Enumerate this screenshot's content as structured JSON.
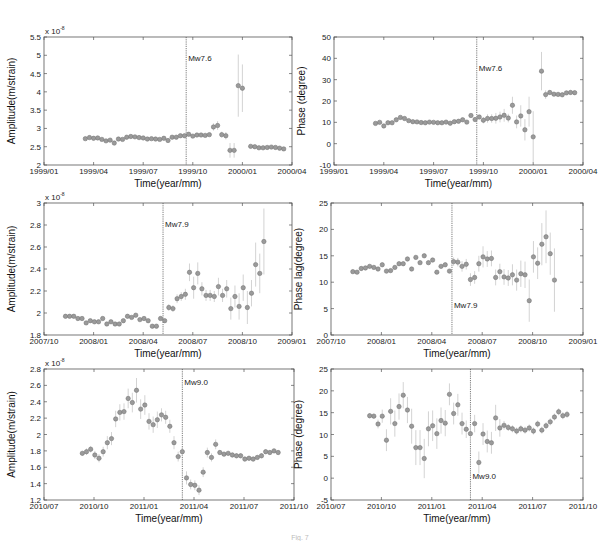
{
  "figure": {
    "caption_fragment": "Fig. 7"
  },
  "chart_data": [
    {
      "id": "p1",
      "type": "scatter",
      "title": "",
      "xlabel": "Time(year/mm)",
      "ylabel": "Amplitude(m/strain)",
      "y_multiplier": "x 10^-8",
      "xlim": [
        0,
        15
      ],
      "ylim": [
        2,
        5.5
      ],
      "xticks": [
        0,
        3,
        6,
        9,
        12,
        15
      ],
      "xticklabels": [
        "1999/01",
        "1999/04",
        "1999/07",
        "1999/10",
        "2000/01",
        "2000/04"
      ],
      "yticks": [
        2,
        2.5,
        3,
        3.5,
        4,
        4.5,
        5,
        5.5
      ],
      "yticklabels": [
        "2",
        "2.5",
        "3",
        "3.5",
        "4",
        "4.5",
        "5",
        "5.5"
      ],
      "event": {
        "x": 8.6,
        "label": "Mw7.6",
        "label_y": 4.85
      },
      "x": [
        2.5,
        2.75,
        3.0,
        3.25,
        3.5,
        3.75,
        4.0,
        4.25,
        4.5,
        4.75,
        5.0,
        5.25,
        5.5,
        5.75,
        6.0,
        6.25,
        6.5,
        6.75,
        7.0,
        7.25,
        7.5,
        7.75,
        8.0,
        8.25,
        8.5,
        8.75,
        9.0,
        9.25,
        9.5,
        9.75,
        10.0,
        10.25,
        10.5,
        10.75,
        11.0,
        11.25,
        11.5,
        11.75,
        12.0,
        12.5,
        12.75,
        13.0,
        13.25,
        13.5,
        13.75,
        14.0,
        14.25,
        14.5
      ],
      "values": [
        2.72,
        2.75,
        2.73,
        2.74,
        2.7,
        2.66,
        2.68,
        2.6,
        2.71,
        2.7,
        2.76,
        2.78,
        2.77,
        2.75,
        2.74,
        2.71,
        2.72,
        2.71,
        2.7,
        2.73,
        2.67,
        2.76,
        2.76,
        2.8,
        2.8,
        2.84,
        2.79,
        2.82,
        2.82,
        2.81,
        2.83,
        3.04,
        3.08,
        2.83,
        2.8,
        2.4,
        2.4,
        4.17,
        4.1,
        2.51,
        2.5,
        2.47,
        2.47,
        2.48,
        2.49,
        2.48,
        2.46,
        2.44
      ],
      "errors": [
        0.03,
        0.03,
        0.03,
        0.03,
        0.03,
        0.03,
        0.03,
        0.03,
        0.03,
        0.03,
        0.03,
        0.03,
        0.03,
        0.03,
        0.03,
        0.03,
        0.03,
        0.03,
        0.03,
        0.03,
        0.03,
        0.03,
        0.03,
        0.03,
        0.03,
        0.03,
        0.03,
        0.03,
        0.03,
        0.03,
        0.03,
        0.1,
        0.12,
        0.08,
        0.1,
        0.2,
        0.2,
        0.85,
        0.65,
        0.05,
        0.03,
        0.03,
        0.03,
        0.03,
        0.03,
        0.03,
        0.03,
        0.03
      ]
    },
    {
      "id": "p2",
      "type": "scatter",
      "title": "",
      "xlabel": "Time(year/mm)",
      "ylabel": "Phase (degree)",
      "xlim": [
        0,
        15
      ],
      "ylim": [
        -10,
        50
      ],
      "xticks": [
        0,
        3,
        6,
        9,
        12,
        15
      ],
      "xticklabels": [
        "1999/01",
        "1999/04",
        "1999/07",
        "1999/10",
        "2000/01",
        "2000/04"
      ],
      "yticks": [
        -10,
        0,
        10,
        20,
        30,
        40,
        50
      ],
      "yticklabels": [
        "-10",
        "0",
        "10",
        "20",
        "30",
        "40",
        "50"
      ],
      "event": {
        "x": 8.6,
        "label": "Mw7.6",
        "label_y": 34
      },
      "x": [
        2.5,
        2.75,
        3.0,
        3.25,
        3.5,
        3.75,
        4.0,
        4.25,
        4.5,
        4.75,
        5.0,
        5.25,
        5.5,
        5.75,
        6.0,
        6.25,
        6.5,
        6.75,
        7.0,
        7.25,
        7.5,
        7.75,
        8.0,
        8.25,
        8.5,
        8.75,
        9.0,
        9.25,
        9.5,
        9.75,
        10.0,
        10.25,
        10.5,
        10.75,
        11.0,
        11.25,
        11.5,
        11.75,
        12.0,
        12.5,
        12.75,
        13.0,
        13.25,
        13.5,
        13.75,
        14.0,
        14.25,
        14.5
      ],
      "values": [
        9.5,
        10,
        8.3,
        9.8,
        9.8,
        11.2,
        12.3,
        11.8,
        10.8,
        10.3,
        10.2,
        9.9,
        9.8,
        10.1,
        10.0,
        9.8,
        9.8,
        10.1,
        9.6,
        10.3,
        10.5,
        11.2,
        10.1,
        13.2,
        11.3,
        12.5,
        11,
        11.8,
        11.8,
        11.9,
        12.5,
        13.3,
        12,
        18,
        10.2,
        13,
        6.5,
        15,
        3.2,
        34,
        23,
        24,
        23.2,
        23.1,
        22.9,
        23.8,
        24,
        23.9,
        23.5,
        23
      ],
      "errors": [
        0.5,
        0.5,
        0.5,
        0.5,
        0.5,
        0.5,
        0.5,
        0.5,
        0.5,
        0.5,
        0.5,
        0.5,
        0.5,
        0.5,
        0.5,
        0.5,
        0.5,
        0.5,
        0.5,
        0.5,
        0.5,
        0.5,
        0.5,
        0.5,
        0.5,
        0.5,
        1.5,
        2,
        2,
        2.5,
        2.5,
        3,
        2,
        4,
        3,
        5,
        5,
        7,
        12,
        9,
        2,
        1,
        1,
        1,
        1,
        1,
        1,
        1,
        1,
        1
      ]
    },
    {
      "id": "p3",
      "type": "scatter",
      "title": "",
      "xlabel": "Time(year/mm)",
      "ylabel": "Amplitude(m/strain)",
      "y_multiplier": "x 10^-8",
      "xlim": [
        0,
        15
      ],
      "ylim": [
        1.8,
        3.0
      ],
      "xticks": [
        0,
        3,
        6,
        9,
        12,
        15
      ],
      "xticklabels": [
        "2007/10",
        "2008/01",
        "2008/04",
        "2008/07",
        "2008/10",
        "2009/01"
      ],
      "yticks": [
        1.8,
        2.0,
        2.2,
        2.4,
        2.6,
        2.8,
        3.0
      ],
      "yticklabels": [
        "1.8",
        "2",
        "2.2",
        "2.4",
        "2.6",
        "2.8",
        "3"
      ],
      "event": {
        "x": 7.2,
        "label": "Mw7.9",
        "label_y": 2.78
      },
      "x": [
        1.3,
        1.55,
        1.8,
        2.05,
        2.3,
        2.55,
        2.8,
        3.05,
        3.3,
        3.55,
        3.8,
        4.05,
        4.3,
        4.55,
        4.8,
        5.05,
        5.3,
        5.55,
        5.8,
        6.05,
        6.3,
        6.55,
        6.8,
        7.05,
        7.3,
        7.55,
        7.8,
        8.05,
        8.3,
        8.55,
        8.8,
        9.05,
        9.3,
        9.55,
        9.8,
        10.05,
        10.3,
        10.55,
        10.8,
        11.05,
        11.3,
        11.55,
        11.8,
        12.05,
        12.3,
        12.55,
        12.8,
        13.05,
        13.3
      ],
      "values": [
        1.97,
        1.97,
        1.97,
        1.95,
        1.95,
        1.91,
        1.93,
        1.92,
        1.92,
        1.95,
        1.9,
        1.92,
        1.9,
        1.9,
        1.93,
        1.97,
        1.96,
        1.98,
        1.94,
        1.95,
        1.93,
        1.88,
        1.88,
        1.95,
        1.93,
        2.05,
        2.04,
        2.13,
        2.15,
        2.17,
        2.37,
        2.23,
        2.36,
        2.22,
        2.16,
        2.16,
        2.15,
        2.24,
        2.16,
        2.22,
        2.04,
        2.15,
        2.06,
        2.23,
        2.05,
        2.18,
        2.44,
        2.36,
        2.65,
        2.36,
        2.28,
        2.12,
        2.21
      ],
      "errors": [
        0.01,
        0.01,
        0.01,
        0.01,
        0.01,
        0.01,
        0.01,
        0.01,
        0.01,
        0.01,
        0.01,
        0.01,
        0.01,
        0.01,
        0.01,
        0.01,
        0.01,
        0.01,
        0.01,
        0.01,
        0.01,
        0.01,
        0.01,
        0.01,
        0.01,
        0.03,
        0.03,
        0.04,
        0.04,
        0.05,
        0.08,
        0.1,
        0.1,
        0.06,
        0.05,
        0.05,
        0.05,
        0.08,
        0.06,
        0.08,
        0.1,
        0.1,
        0.12,
        0.12,
        0.15,
        0.12,
        0.2,
        0.18,
        0.3,
        0.2,
        0.15,
        0.15,
        0.12
      ]
    },
    {
      "id": "p4",
      "type": "scatter",
      "title": "",
      "xlabel": "Time(year/mm)",
      "ylabel": "Phase lag(degree)",
      "xlim": [
        0,
        15
      ],
      "ylim": [
        0,
        25
      ],
      "xticks": [
        0,
        3,
        6,
        9,
        12,
        15
      ],
      "xticklabels": [
        "2007/10",
        "2008/01",
        "2008/04",
        "2008/07",
        "2008/10",
        "2009/01"
      ],
      "yticks": [
        0,
        5,
        10,
        15,
        20,
        25
      ],
      "yticklabels": [
        "0",
        "5",
        "10",
        "15",
        "20",
        "25"
      ],
      "event": {
        "x": 7.2,
        "label": "Mw7.9",
        "label_y": 5.2
      },
      "x": [
        1.3,
        1.55,
        1.8,
        2.05,
        2.3,
        2.55,
        2.8,
        3.05,
        3.3,
        3.55,
        3.8,
        4.05,
        4.3,
        4.55,
        4.8,
        5.05,
        5.3,
        5.55,
        5.8,
        6.05,
        6.3,
        6.55,
        6.8,
        7.05,
        7.3,
        7.55,
        7.8,
        8.05,
        8.3,
        8.55,
        8.8,
        9.05,
        9.3,
        9.55,
        9.8,
        10.05,
        10.3,
        10.55,
        10.8,
        11.05,
        11.3,
        11.55,
        11.8,
        12.05,
        12.3,
        12.55,
        12.8,
        13.05,
        13.3
      ],
      "values": [
        12,
        11.9,
        12.6,
        12.7,
        13,
        12.8,
        12.5,
        13.3,
        12.1,
        12.2,
        12.8,
        13.5,
        13.5,
        14.4,
        12.5,
        14.7,
        13.7,
        15,
        13.7,
        14.2,
        11.9,
        13,
        13.3,
        12.1,
        13.9,
        13.8,
        13,
        13.4,
        10.5,
        10.9,
        13.5,
        14.8,
        14.4,
        14.5,
        10.9,
        12,
        11,
        10.8,
        11.4,
        10.4,
        11.6,
        11.4,
        6.5,
        14.8,
        13.6,
        17.2,
        18.6,
        15.4,
        10.4,
        13.2,
        8.4,
        13.8,
        12.9
      ],
      "errors": [
        0.4,
        0.4,
        0.4,
        0.4,
        0.4,
        0.4,
        0.4,
        0.4,
        0.4,
        0.4,
        0.4,
        0.4,
        0.4,
        0.4,
        0.4,
        0.4,
        0.4,
        0.4,
        0.4,
        0.4,
        0.4,
        0.4,
        0.4,
        0.4,
        0.8,
        0.8,
        1,
        1,
        1.2,
        1.2,
        1.5,
        2,
        1.5,
        1.5,
        1.5,
        1.5,
        1.5,
        1.5,
        2,
        2,
        2.5,
        2.5,
        4,
        3,
        3,
        4,
        5,
        4,
        6,
        5,
        5.5,
        2.5,
        2
      ]
    },
    {
      "id": "p5",
      "type": "scatter",
      "title": "",
      "xlabel": "Time(year/mm)",
      "ylabel": "Amplitude(m/strain)",
      "y_multiplier": "x 10^-8",
      "xlim": [
        0,
        15
      ],
      "ylim": [
        1.2,
        2.8
      ],
      "xticks": [
        0,
        3,
        6,
        9,
        12,
        15
      ],
      "xticklabels": [
        "2010/07",
        "2010/10",
        "2011/01",
        "2011/04",
        "2011/07",
        "2011/10"
      ],
      "yticks": [
        1.2,
        1.4,
        1.6,
        1.8,
        2.0,
        2.2,
        2.4,
        2.6,
        2.8
      ],
      "yticklabels": [
        "1.2",
        "1.4",
        "1.6",
        "1.8",
        "2",
        "2.2",
        "2.4",
        "2.6",
        "2.8"
      ],
      "event": {
        "x": 8.3,
        "label": "Mw9.0",
        "label_y": 2.6
      },
      "x": [
        2.3,
        2.55,
        2.8,
        3.05,
        3.3,
        3.55,
        3.8,
        4.05,
        4.3,
        4.55,
        4.8,
        5.05,
        5.3,
        5.55,
        5.8,
        6.05,
        6.3,
        6.55,
        6.8,
        7.05,
        7.3,
        7.55,
        7.8,
        8.05,
        8.3,
        8.55,
        8.8,
        9.05,
        9.3,
        9.55,
        9.8,
        10.05,
        10.3,
        10.55,
        10.8,
        11.05,
        11.3,
        11.55,
        11.8,
        12.05,
        12.3,
        12.55,
        12.8,
        13.05,
        13.3,
        13.55,
        13.8,
        14.05
      ],
      "values": [
        1.77,
        1.79,
        1.82,
        1.75,
        1.71,
        1.79,
        1.9,
        1.95,
        2.19,
        2.27,
        2.28,
        2.44,
        2.39,
        2.54,
        2.31,
        2.36,
        2.16,
        2.12,
        2.18,
        2.24,
        2.21,
        2.1,
        1.9,
        1.73,
        1.79,
        1.47,
        1.39,
        1.38,
        1.32,
        1.54,
        1.78,
        1.72,
        1.88,
        1.78,
        1.76,
        1.77,
        1.75,
        1.74,
        1.74,
        1.7,
        1.71,
        1.7,
        1.72,
        1.74,
        1.79,
        1.78,
        1.8,
        1.78,
        1.77,
        1.79,
        1.78,
        1.87,
        1.9
      ],
      "errors": [
        0.03,
        0.04,
        0.04,
        0.05,
        0.05,
        0.06,
        0.08,
        0.08,
        0.1,
        0.1,
        0.1,
        0.12,
        0.12,
        0.15,
        0.12,
        0.12,
        0.1,
        0.1,
        0.1,
        0.08,
        0.08,
        0.08,
        0.08,
        0.06,
        0.06,
        0.08,
        0.06,
        0.06,
        0.06,
        0.06,
        0.06,
        0.05,
        0.06,
        0.03,
        0.03,
        0.03,
        0.03,
        0.03,
        0.03,
        0.03,
        0.03,
        0.03,
        0.03,
        0.03,
        0.03,
        0.03,
        0.03,
        0.03,
        0.03,
        0.03,
        0.03,
        0.03,
        0.03
      ]
    },
    {
      "id": "p6",
      "type": "scatter",
      "title": "",
      "xlabel": "Time(year/mm)",
      "ylabel": "Phase (degree)",
      "xlim": [
        0,
        15
      ],
      "ylim": [
        -5,
        25
      ],
      "xticks": [
        0,
        3,
        6,
        9,
        12,
        15
      ],
      "xticklabels": [
        "2010/07",
        "2010/10",
        "2011/01",
        "2011/04",
        "2011/07",
        "2011/10"
      ],
      "yticks": [
        -5,
        0,
        5,
        10,
        15,
        20,
        25
      ],
      "yticklabels": [
        "-5",
        "0",
        "5",
        "10",
        "15",
        "20",
        "25"
      ],
      "event": {
        "x": 8.3,
        "label": "Mw9.0",
        "label_y": -0.2
      },
      "x": [
        2.3,
        2.55,
        2.8,
        3.05,
        3.3,
        3.55,
        3.8,
        4.05,
        4.3,
        4.55,
        4.8,
        5.05,
        5.3,
        5.55,
        5.8,
        6.05,
        6.3,
        6.55,
        6.8,
        7.05,
        7.3,
        7.55,
        7.8,
        8.05,
        8.3,
        8.55,
        8.8,
        9.05,
        9.3,
        9.55,
        9.8,
        10.05,
        10.3,
        10.55,
        10.8,
        11.05,
        11.3,
        11.55,
        11.8,
        12.05,
        12.3,
        12.55,
        12.8,
        13.05,
        13.3,
        13.55,
        13.8,
        14.05
      ],
      "values": [
        14.3,
        14.2,
        12.4,
        14.2,
        8.7,
        15.3,
        12.5,
        16.4,
        19,
        15.6,
        11.9,
        7,
        7,
        4.5,
        11.3,
        12,
        10.2,
        13.2,
        12.6,
        19.2,
        14.8,
        16.8,
        12.5,
        11.2,
        10.2,
        12.5,
        3.6,
        10.1,
        8.4,
        8.1,
        13.8,
        11.5,
        12.1,
        11.6,
        11.3,
        10.8,
        11.3,
        11,
        11.5,
        10.8,
        12.4,
        11,
        12,
        12.9,
        14,
        15.2,
        14.3,
        14.6,
        13.2,
        14.3,
        13.4,
        14.3,
        12.9
      ],
      "errors": [
        0.6,
        0.6,
        1,
        1.5,
        2.5,
        3,
        3,
        3,
        3,
        3,
        4,
        4,
        4,
        4.5,
        4,
        3.5,
        3.5,
        3,
        3,
        2.5,
        2.5,
        2.5,
        2.5,
        2,
        2,
        2,
        2.5,
        2.5,
        2.5,
        2.5,
        3,
        2,
        1,
        0.8,
        0.8,
        0.8,
        0.8,
        0.8,
        0.8,
        0.8,
        0.8,
        0.8,
        0.8,
        0.8,
        0.8,
        0.8,
        0.8,
        0.8,
        0.8,
        0.8,
        0.8,
        0.8,
        0.8
      ]
    }
  ]
}
